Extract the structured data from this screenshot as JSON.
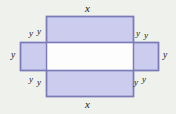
{
  "figure": {
    "background_color": "#eef1ec",
    "fill_color": "#ccccee",
    "stroke_color": "#7b7bb8",
    "label_color": "#1a1a1a",
    "shapes": {
      "vertical_rect": {
        "x": 46,
        "y": 16,
        "width": 88,
        "height": 81
      },
      "horizontal_rect": {
        "x": 20,
        "y": 42,
        "width": 139,
        "height": 29
      },
      "overlap_rect": {
        "x": 46,
        "y": 42,
        "width": 88,
        "height": 29
      }
    },
    "labels": {
      "top_x": "x",
      "bottom_x": "x",
      "left_y": "y",
      "right_y": "y",
      "corner_top_left_y1": "y",
      "corner_top_left_y2": "y",
      "corner_top_right_y1": "y",
      "corner_top_right_y2": "y",
      "corner_bottom_left_y1": "y",
      "corner_bottom_left_y2": "y",
      "corner_bottom_right_y1": "y",
      "corner_bottom_right_y2": "y"
    }
  }
}
